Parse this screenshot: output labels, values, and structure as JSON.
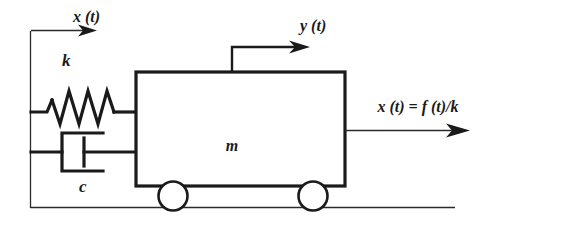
{
  "diagram": {
    "labels": {
      "displacement_left": "x (t)",
      "spring_constant": "k",
      "damping_constant": "c",
      "mass": "m",
      "displacement_top": "y (t)",
      "force_expression": "x (t) = f (t)/k"
    },
    "colors": {
      "ink": "#1a1a1a",
      "ink_light": "#2b2b2b",
      "background": "#ffffff"
    },
    "elements": {
      "wall": "fixed-vertical-wall",
      "ground": "ground-line",
      "spring": "helical-spring",
      "damper": "dashpot-damper",
      "mass_block": "rigid-mass-block",
      "wheels": "two-rolling-wheels"
    }
  }
}
